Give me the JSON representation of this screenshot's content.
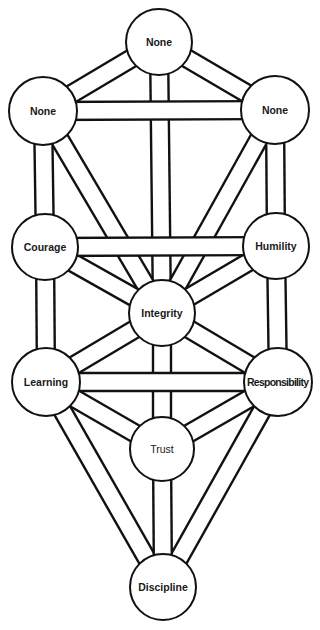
{
  "diagram": {
    "type": "tree-of-life",
    "colors": {
      "stroke": "#111111",
      "fill": "#ffffff",
      "text": "#1a1a1a"
    },
    "path_width": 18,
    "nodes": [
      {
        "id": "top",
        "label": "None",
        "x": 159,
        "y": 42,
        "r": 33
      },
      {
        "id": "upper_left",
        "label": "None",
        "x": 43,
        "y": 111,
        "r": 34
      },
      {
        "id": "upper_right",
        "label": "None",
        "x": 275,
        "y": 110,
        "r": 34
      },
      {
        "id": "courage",
        "label": "Courage",
        "x": 45,
        "y": 247,
        "r": 33
      },
      {
        "id": "humility",
        "label": "Humility",
        "x": 276,
        "y": 246,
        "r": 33
      },
      {
        "id": "integrity",
        "label": "Integrity",
        "x": 162,
        "y": 313,
        "r": 33
      },
      {
        "id": "learning",
        "label": "Learning",
        "x": 46,
        "y": 382,
        "r": 34
      },
      {
        "id": "responsibility",
        "label": "Responsibility",
        "x": 278,
        "y": 382,
        "r": 34
      },
      {
        "id": "trust",
        "label": "Trust",
        "x": 162,
        "y": 449,
        "r": 32
      },
      {
        "id": "discipline",
        "label": "Discipline",
        "x": 163,
        "y": 587,
        "r": 33
      }
    ],
    "edges": [
      [
        "top",
        "integrity"
      ],
      [
        "upper_left",
        "integrity"
      ],
      [
        "upper_right",
        "integrity"
      ],
      [
        "courage",
        "integrity"
      ],
      [
        "humility",
        "integrity"
      ],
      [
        "integrity",
        "learning"
      ],
      [
        "integrity",
        "responsibility"
      ],
      [
        "integrity",
        "trust"
      ],
      [
        "top",
        "upper_left"
      ],
      [
        "top",
        "upper_right"
      ],
      [
        "upper_left",
        "upper_right"
      ],
      [
        "upper_left",
        "courage"
      ],
      [
        "upper_right",
        "humility"
      ],
      [
        "courage",
        "humility"
      ],
      [
        "courage",
        "learning"
      ],
      [
        "humility",
        "responsibility"
      ],
      [
        "learning",
        "responsibility"
      ],
      [
        "learning",
        "trust"
      ],
      [
        "responsibility",
        "trust"
      ],
      [
        "learning",
        "discipline"
      ],
      [
        "responsibility",
        "discipline"
      ],
      [
        "trust",
        "discipline"
      ]
    ]
  }
}
